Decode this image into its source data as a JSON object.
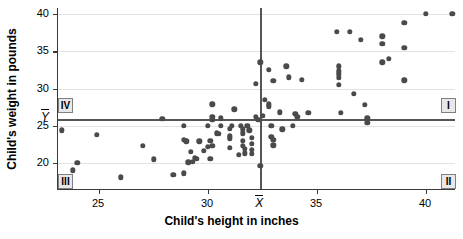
{
  "chart_data": {
    "type": "scatter",
    "title": "",
    "xlabel": "Child's height in inches",
    "ylabel": "Child's weight in pounds",
    "xlim": [
      23.0,
      41.5
    ],
    "ylim": [
      17.8,
      40.8
    ],
    "xticks": [
      25,
      30,
      35,
      40
    ],
    "yticks": [
      20,
      25,
      30,
      35,
      40
    ],
    "grid": true,
    "legend": "none",
    "mean_x": 32.4,
    "mean_y": 25.9,
    "mean_x_label": "X",
    "mean_y_label": "Y",
    "quadrants": [
      {
        "name": "I",
        "label": "I",
        "corner": "top-right"
      },
      {
        "name": "II",
        "label": "II",
        "corner": "bottom-right"
      },
      {
        "name": "III",
        "label": "III",
        "corner": "bottom-left"
      },
      {
        "name": "IV",
        "label": "IV",
        "corner": "top-left"
      }
    ],
    "points": [
      [
        23.3,
        24.4
      ],
      [
        23.8,
        19.0
      ],
      [
        24.0,
        20.0
      ],
      [
        24.9,
        23.8
      ],
      [
        26.0,
        18.1
      ],
      [
        27.0,
        22.3
      ],
      [
        27.5,
        20.5
      ],
      [
        27.9,
        25.9
      ],
      [
        28.4,
        18.4
      ],
      [
        28.9,
        18.6
      ],
      [
        28.9,
        25.0
      ],
      [
        28.9,
        23.1
      ],
      [
        29.0,
        22.9
      ],
      [
        29.1,
        20.1
      ],
      [
        29.2,
        21.5
      ],
      [
        29.3,
        20.2
      ],
      [
        29.4,
        20.7
      ],
      [
        29.5,
        20.6
      ],
      [
        29.6,
        22.9
      ],
      [
        29.8,
        21.6
      ],
      [
        30.0,
        25.0
      ],
      [
        30.0,
        22.2
      ],
      [
        30.1,
        23.0
      ],
      [
        30.1,
        20.6
      ],
      [
        30.2,
        22.3
      ],
      [
        30.2,
        26.2
      ],
      [
        30.2,
        25.8
      ],
      [
        30.2,
        27.9
      ],
      [
        30.4,
        24.0
      ],
      [
        30.5,
        23.9
      ],
      [
        30.6,
        25.0
      ],
      [
        30.6,
        26.0
      ],
      [
        31.0,
        24.6
      ],
      [
        31.0,
        23.6
      ],
      [
        31.0,
        23.3
      ],
      [
        31.0,
        22.0
      ],
      [
        31.1,
        25.0
      ],
      [
        31.2,
        27.2
      ],
      [
        31.4,
        21.1
      ],
      [
        31.5,
        25.0
      ],
      [
        31.6,
        24.5
      ],
      [
        31.6,
        24.0
      ],
      [
        31.6,
        23.0
      ],
      [
        31.6,
        22.3
      ],
      [
        31.7,
        21.9
      ],
      [
        31.7,
        21.3
      ],
      [
        31.8,
        25.0
      ],
      [
        31.9,
        24.4
      ],
      [
        32.0,
        23.4
      ],
      [
        32.0,
        22.6
      ],
      [
        32.0,
        21.8
      ],
      [
        32.0,
        21.2
      ],
      [
        32.2,
        26.2
      ],
      [
        32.2,
        30.6
      ],
      [
        32.3,
        25.8
      ],
      [
        32.4,
        33.5
      ],
      [
        32.4,
        19.6
      ],
      [
        32.5,
        26.3
      ],
      [
        32.6,
        28.5
      ],
      [
        32.8,
        32.5
      ],
      [
        32.8,
        27.6
      ],
      [
        32.8,
        27.9
      ],
      [
        32.9,
        25.0
      ],
      [
        32.9,
        23.5
      ],
      [
        33.0,
        31.0
      ],
      [
        33.0,
        23.1
      ],
      [
        33.0,
        22.4
      ],
      [
        33.3,
        26.8
      ],
      [
        33.4,
        24.5
      ],
      [
        33.6,
        33.0
      ],
      [
        33.7,
        31.5
      ],
      [
        33.9,
        25.0
      ],
      [
        34.0,
        26.6
      ],
      [
        34.1,
        26.2
      ],
      [
        34.3,
        31.2
      ],
      [
        34.6,
        26.7
      ],
      [
        35.9,
        37.6
      ],
      [
        36.0,
        33.0
      ],
      [
        36.0,
        32.3
      ],
      [
        36.0,
        31.9
      ],
      [
        36.0,
        31.4
      ],
      [
        36.0,
        30.5
      ],
      [
        36.1,
        26.7
      ],
      [
        36.5,
        37.6
      ],
      [
        36.7,
        29.3
      ],
      [
        37.0,
        36.5
      ],
      [
        37.2,
        27.8
      ],
      [
        37.3,
        26.0
      ],
      [
        37.3,
        25.4
      ],
      [
        38.0,
        37.0
      ],
      [
        38.0,
        36.0
      ],
      [
        38.0,
        33.5
      ],
      [
        38.3,
        34.0
      ],
      [
        39.0,
        38.8
      ],
      [
        39.0,
        35.5
      ],
      [
        39.0,
        31.1
      ],
      [
        40.0,
        40.0
      ],
      [
        41.2,
        40.0
      ]
    ]
  }
}
